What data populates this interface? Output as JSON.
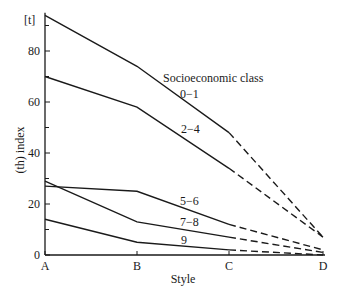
{
  "chart_data": {
    "type": "line",
    "title": "",
    "xlabel": "Style",
    "ylabel": "(th) index",
    "y_unit_label": "[t]",
    "legend_title": "Socioeconomic class",
    "categories": [
      "A",
      "B",
      "C",
      "D"
    ],
    "ylim": [
      0,
      95
    ],
    "y_ticks_major": [
      0,
      20,
      40,
      60,
      80
    ],
    "y_ticks_minor": [
      10,
      30,
      50,
      70,
      90
    ],
    "grid": false,
    "dashed_from_category": "C",
    "series": [
      {
        "name": "0−1",
        "values": [
          94,
          74,
          48,
          7
        ]
      },
      {
        "name": "2−4",
        "values": [
          70,
          58,
          34,
          7
        ]
      },
      {
        "name": "5−6",
        "values": [
          27,
          25,
          12,
          2
        ]
      },
      {
        "name": "7−8",
        "values": [
          29,
          13,
          7,
          1
        ]
      },
      {
        "name": "9",
        "values": [
          14,
          5,
          2,
          0
        ]
      }
    ],
    "colors": {
      "line": "#1a1a1a",
      "axis": "#1a1a1a",
      "background": "#ffffff"
    }
  }
}
